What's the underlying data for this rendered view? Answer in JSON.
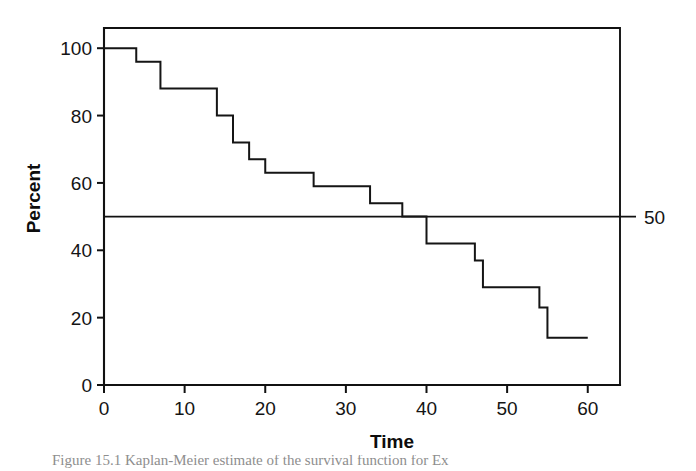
{
  "figure": {
    "caption": "Figure 15.1  Kaplan-Meier estimate of the survival function for Ex"
  },
  "chart_data": {
    "type": "line",
    "subtype": "step",
    "title": "",
    "xlabel": "Time",
    "ylabel": "Percent",
    "xlim": [
      0,
      64
    ],
    "ylim": [
      0,
      106
    ],
    "grid": false,
    "legend": null,
    "xticks": [
      0,
      10,
      20,
      30,
      40,
      50,
      60
    ],
    "xticklabels": [
      "0",
      "10",
      "20",
      "30",
      "40",
      "50",
      "60"
    ],
    "yticks": [
      0,
      20,
      40,
      60,
      80,
      100
    ],
    "yticklabels": [
      "0",
      "20",
      "40",
      "60",
      "80",
      "100"
    ],
    "reference_lines": [
      {
        "orientation": "horizontal",
        "value": 50,
        "label": "50"
      }
    ],
    "series": [
      {
        "name": "Kaplan-Meier survival estimate",
        "step": "post",
        "x": [
          0,
          4,
          7,
          14,
          16,
          18,
          20,
          26,
          33,
          37,
          40,
          40,
          46,
          47,
          54,
          55,
          60
        ],
        "y": [
          100,
          100,
          88,
          88,
          80,
          72,
          67,
          63,
          59,
          54,
          50,
          42,
          42,
          29,
          29,
          14,
          14
        ],
        "points": [
          {
            "time": 0,
            "percent": 100
          },
          {
            "time": 4,
            "percent": 100
          },
          {
            "time": 4,
            "percent": 96
          },
          {
            "time": 7,
            "percent": 96
          },
          {
            "time": 7,
            "percent": 88
          },
          {
            "time": 14,
            "percent": 88
          },
          {
            "time": 14,
            "percent": 80
          },
          {
            "time": 16,
            "percent": 80
          },
          {
            "time": 16,
            "percent": 72
          },
          {
            "time": 18,
            "percent": 72
          },
          {
            "time": 18,
            "percent": 67
          },
          {
            "time": 20,
            "percent": 67
          },
          {
            "time": 20,
            "percent": 63
          },
          {
            "time": 26,
            "percent": 63
          },
          {
            "time": 26,
            "percent": 59
          },
          {
            "time": 33,
            "percent": 59
          },
          {
            "time": 33,
            "percent": 54
          },
          {
            "time": 37,
            "percent": 54
          },
          {
            "time": 37,
            "percent": 50
          },
          {
            "time": 40,
            "percent": 50
          },
          {
            "time": 40,
            "percent": 42
          },
          {
            "time": 46,
            "percent": 42
          },
          {
            "time": 46,
            "percent": 37
          },
          {
            "time": 47,
            "percent": 37
          },
          {
            "time": 47,
            "percent": 29
          },
          {
            "time": 54,
            "percent": 29
          },
          {
            "time": 54,
            "percent": 23
          },
          {
            "time": 55,
            "percent": 23
          },
          {
            "time": 55,
            "percent": 14
          },
          {
            "time": 60,
            "percent": 14
          }
        ]
      }
    ]
  }
}
